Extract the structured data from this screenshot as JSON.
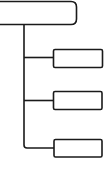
{
  "diagram": {
    "type": "tree",
    "stroke_color": "#1a1a1a",
    "background": "#ffffff",
    "root": {
      "label": ""
    },
    "children": [
      {
        "label": ""
      },
      {
        "label": ""
      },
      {
        "label": ""
      }
    ]
  }
}
